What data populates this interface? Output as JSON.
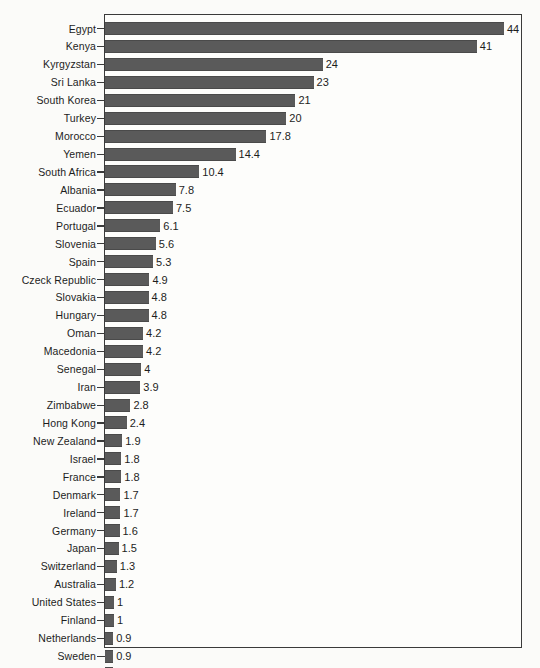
{
  "chart_data": {
    "type": "bar",
    "orientation": "horizontal",
    "title": "",
    "subtitle": "",
    "xlabel": "",
    "ylabel": "",
    "grid": false,
    "legend": null,
    "xlim": [
      0,
      46
    ],
    "axis_frame": "full-box",
    "bar_color": "#5a5a5a",
    "background_color": "#fbfbf9",
    "value_label_position": "outside-end",
    "sorted": "descending",
    "categories": [
      "Egypt",
      "Kenya",
      "Kyrgyzstan",
      "Sri Lanka",
      "South Korea",
      "Turkey",
      "Morocco",
      "Yemen",
      "South Africa",
      "Albania",
      "Ecuador",
      "Portugal",
      "Slovenia",
      "Spain",
      "Czeck Republic",
      "Slovakia",
      "Hungary",
      "Oman",
      "Macedonia",
      "Senegal",
      "Iran",
      "Zimbabwe",
      "Hong Kong",
      "New Zealand",
      "Israel",
      "France",
      "Denmark",
      "Ireland",
      "Germany",
      "Japan",
      "Switzerland",
      "Australia",
      "United States",
      "Finland",
      "Netherlands",
      "Sweden",
      "United Kingdom"
    ],
    "values": [
      44,
      41,
      24,
      23,
      21,
      20,
      17.8,
      14.4,
      10.4,
      7.8,
      7.5,
      6.1,
      5.6,
      5.3,
      4.9,
      4.8,
      4.8,
      4.2,
      4.2,
      4,
      3.9,
      2.8,
      2.4,
      1.9,
      1.8,
      1.8,
      1.7,
      1.7,
      1.6,
      1.5,
      1.3,
      1.2,
      1,
      1,
      0.9,
      0.9,
      0.9
    ],
    "value_labels": [
      "44",
      "41",
      "24",
      "23",
      "21",
      "20",
      "17.8",
      "14.4",
      "10.4",
      "7.8",
      "7.5",
      "6.1",
      "5.6",
      "5.3",
      "4.9",
      "4.8",
      "4.8",
      "4.2",
      "4.2",
      "4",
      "3.9",
      "2.8",
      "2.4",
      "1.9",
      "1.8",
      "1.8",
      "1.7",
      "1.7",
      "1.6",
      "1.5",
      "1.3",
      "1.2",
      "1",
      "1",
      "0.9",
      "0.9",
      "0.9"
    ]
  }
}
